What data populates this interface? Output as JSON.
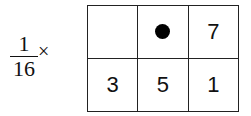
{
  "scale_factor": {
    "numerator": "1",
    "denominator": "16",
    "operator": "×"
  },
  "kernel": {
    "rows": [
      [
        {
          "type": "empty",
          "value": ""
        },
        {
          "type": "current-pixel",
          "value": ""
        },
        {
          "type": "weight",
          "value": "7"
        }
      ],
      [
        {
          "type": "weight",
          "value": "3"
        },
        {
          "type": "weight",
          "value": "5"
        },
        {
          "type": "weight",
          "value": "1"
        }
      ]
    ]
  }
}
